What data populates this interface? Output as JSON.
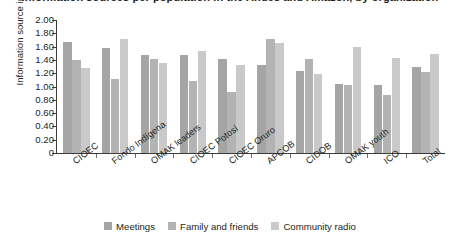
{
  "chart_data": {
    "type": "bar",
    "title": "Information sources per population in the Andes and Amazon, by organization",
    "xlabel": "",
    "ylabel": "Information source index",
    "ylim": [
      0,
      2.0
    ],
    "ytick_labels": [
      "0",
      "0.20",
      "0.40",
      "0.60",
      "0.80",
      "1.00",
      "1.20",
      "1.40",
      "1.60",
      "1.80",
      "2.00"
    ],
    "ytick_values": [
      0,
      0.2,
      0.4,
      0.6,
      0.8,
      1.0,
      1.2,
      1.4,
      1.6,
      1.8,
      2.0
    ],
    "grid": false,
    "legend_position": "bottom",
    "categories": [
      "CIOEC",
      "Fondo Indígena",
      "OMAK leaders",
      "CIOEC Potosí",
      "CIOEC Oruro",
      "APCOB",
      "CIDOB",
      "OMAK youth",
      "ICO",
      "Total"
    ],
    "series": [
      {
        "name": "Meetings",
        "color": "#a5a5a5",
        "values": [
          1.67,
          1.58,
          1.48,
          1.48,
          1.41,
          1.32,
          1.24,
          1.04,
          1.02,
          1.29
        ]
      },
      {
        "name": "Family and friends",
        "color": "#b3b3b3",
        "values": [
          1.4,
          1.11,
          1.42,
          1.09,
          0.92,
          1.72,
          1.42,
          1.02,
          0.87,
          1.22
        ]
      },
      {
        "name": "Community radio",
        "color": "#c9c9c9",
        "values": [
          1.28,
          1.72,
          1.35,
          1.53,
          1.33,
          1.66,
          1.19,
          1.59,
          1.43,
          1.49
        ]
      }
    ]
  }
}
